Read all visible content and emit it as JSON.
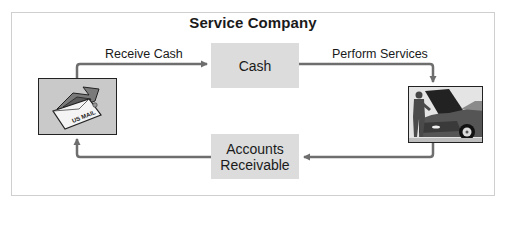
{
  "diagram": {
    "title": "Service Company",
    "nodes": {
      "cash": {
        "label": "Cash"
      },
      "accounts_receivable": {
        "line1": "Accounts",
        "line2": "Receivable"
      },
      "mail_image": {
        "description": "Envelope with cash labeled US MAIL",
        "text": "US MAIL"
      },
      "car_image": {
        "description": "Mechanic standing beside a car with an open hood"
      }
    },
    "edges": [
      {
        "from": "mail_image",
        "to": "cash",
        "label": "Receive Cash"
      },
      {
        "from": "cash",
        "to": "car_image",
        "label": "Perform Services"
      },
      {
        "from": "car_image",
        "to": "accounts_receivable",
        "label": ""
      },
      {
        "from": "accounts_receivable",
        "to": "mail_image",
        "label": ""
      }
    ],
    "colors": {
      "box_fill": "#dcdcdc",
      "arrow": "#6e6e6e",
      "frame": "#cfcfcf",
      "text": "#1a1a1a"
    }
  }
}
